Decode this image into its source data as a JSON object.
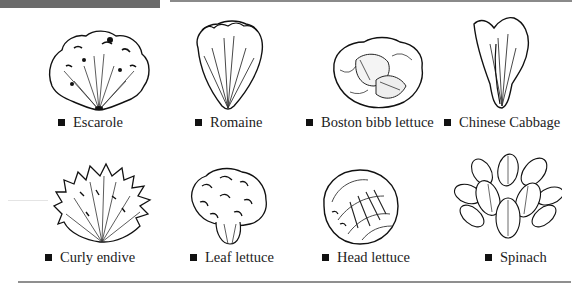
{
  "page": {
    "accent_bar_color": "#6b6b6b",
    "rule_color": "#8a8a8a"
  },
  "items": [
    {
      "label": "Escarole",
      "icon": "escarole-illustration"
    },
    {
      "label": "Romaine",
      "icon": "romaine-illustration"
    },
    {
      "label": "Boston bibb lettuce",
      "icon": "boston-bibb-illustration"
    },
    {
      "label": "Chinese Cabbage",
      "icon": "chinese-cabbage-illustration"
    },
    {
      "label": "Curly endive",
      "icon": "curly-endive-illustration"
    },
    {
      "label": "Leaf lettuce",
      "icon": "leaf-lettuce-illustration"
    },
    {
      "label": "Head lettuce",
      "icon": "head-lettuce-illustration"
    },
    {
      "label": "Spinach",
      "icon": "spinach-illustration"
    }
  ]
}
